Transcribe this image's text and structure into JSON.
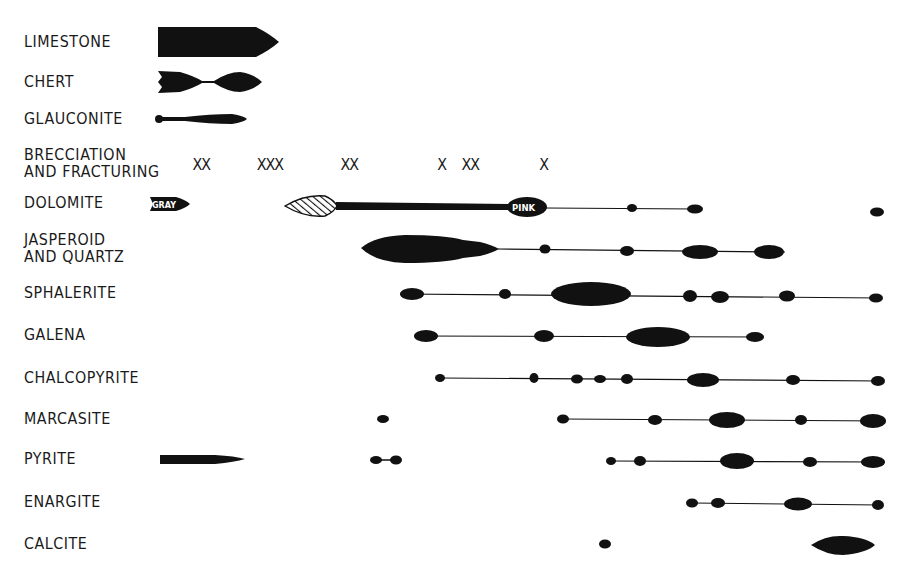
{
  "diagram": {
    "type": "paragenetic-sequence",
    "ink_color": "#111111",
    "background_color": "#ffffff",
    "rows": [
      {
        "id": "limestone",
        "label": "LIMESTONE",
        "y": 42
      },
      {
        "id": "chert",
        "label": "CHERT",
        "y": 82
      },
      {
        "id": "glauconite",
        "label": "GLAUCONITE",
        "y": 119
      },
      {
        "id": "brecciation",
        "label_line1": "BRECCIATION",
        "label_line2": "AND FRACTURING",
        "y": 164
      },
      {
        "id": "dolomite",
        "label": "DOLOMITE",
        "y": 204
      },
      {
        "id": "jasperoid",
        "label_line1": "JASPEROID",
        "label_line2": "AND QUARTZ",
        "y": 248
      },
      {
        "id": "sphalerite",
        "label": "SPHALERITE",
        "y": 294
      },
      {
        "id": "galena",
        "label": "GALENA",
        "y": 336
      },
      {
        "id": "chalcopyrite",
        "label": "CHALCOPYRITE",
        "y": 378
      },
      {
        "id": "marcasite",
        "label": "MARCASITE",
        "y": 419
      },
      {
        "id": "pyrite",
        "label": "PYRITE",
        "y": 460
      },
      {
        "id": "enargite",
        "label": "ENARGITE",
        "y": 503
      },
      {
        "id": "calcite",
        "label": "CALCITE",
        "y": 545
      }
    ],
    "brecciation_marks": [
      {
        "text": "XX",
        "x": 192
      },
      {
        "text": "XXX",
        "x": 256
      },
      {
        "text": "XX",
        "x": 340
      },
      {
        "text": "X",
        "x": 437
      },
      {
        "text": "XX",
        "x": 461
      },
      {
        "text": "X",
        "x": 539
      }
    ],
    "dolomite_annotations": {
      "early": "GRAY",
      "late": "PINK"
    }
  }
}
